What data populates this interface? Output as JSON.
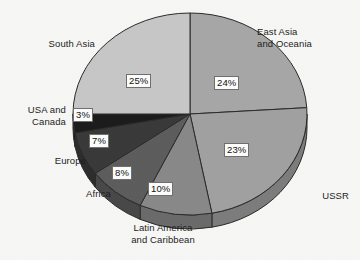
{
  "chart_data": {
    "type": "pie",
    "title": "",
    "subtitle": "",
    "xlabel": "",
    "ylabel": "",
    "legend_position": "none",
    "grid": false,
    "value_unit": "percent",
    "start_angle_deg": 0,
    "direction": "clockwise",
    "categories": [
      "East Asia and Oceania",
      "USSR",
      "Latin America and Caribbean",
      "Africa",
      "Europe",
      "USA and Canada",
      "South Asia"
    ],
    "values": [
      24,
      23,
      10,
      8,
      7,
      3,
      25
    ],
    "data_labels": [
      "24%",
      "23%",
      "10%",
      "8%",
      "7%",
      "3%",
      "25%"
    ],
    "colors": [
      "#a8a8a8",
      "#a2a2a2",
      "#8a8a8a",
      "#5e5e5e",
      "#3a3a3a",
      "#1c1c1c",
      "#c8c8c8"
    ],
    "series": [
      {
        "name": "Share",
        "values": [
          24,
          23,
          10,
          8,
          7,
          3,
          25
        ]
      }
    ]
  },
  "chart": {
    "slices": [
      {
        "name": "East Asia and Oceania",
        "label": "East Asia\nand Oceania",
        "pct_text": "24%",
        "value": 24,
        "color": "#a8a8a8"
      },
      {
        "name": "USSR",
        "label": "USSR",
        "pct_text": "23%",
        "value": 23,
        "color": "#a2a2a2"
      },
      {
        "name": "Latin America and Caribbean",
        "label": "Latin America\nand Caribbean",
        "pct_text": "10%",
        "value": 10,
        "color": "#8a8a8a"
      },
      {
        "name": "Africa",
        "label": "Africa",
        "pct_text": "8%",
        "value": 8,
        "color": "#5e5e5e"
      },
      {
        "name": "Europe",
        "label": "Europe",
        "pct_text": "7%",
        "value": 7,
        "color": "#3a3a3a"
      },
      {
        "name": "USA and Canada",
        "label": "USA and\nCanada",
        "pct_text": "3%",
        "value": 3,
        "color": "#1c1c1c"
      },
      {
        "name": "South Asia",
        "label": "South Asia",
        "pct_text": "25%",
        "value": 25,
        "color": "#c8c8c8"
      }
    ],
    "labels": {
      "east_asia": "East Asia\nand Oceania",
      "ussr": "USSR",
      "latin_america": "Latin America\nand Caribbean",
      "africa": "Africa",
      "europe": "Europe",
      "usa_canada": "USA and\nCanada",
      "south_asia": "South Asia"
    },
    "pcts": {
      "east_asia": "24%",
      "ussr": "23%",
      "latin_america": "10%",
      "africa": "8%",
      "europe": "7%",
      "usa_canada": "3%",
      "south_asia": "25%"
    },
    "outline_color": "#2b2b2b",
    "background_color": "#f8f8f6"
  }
}
